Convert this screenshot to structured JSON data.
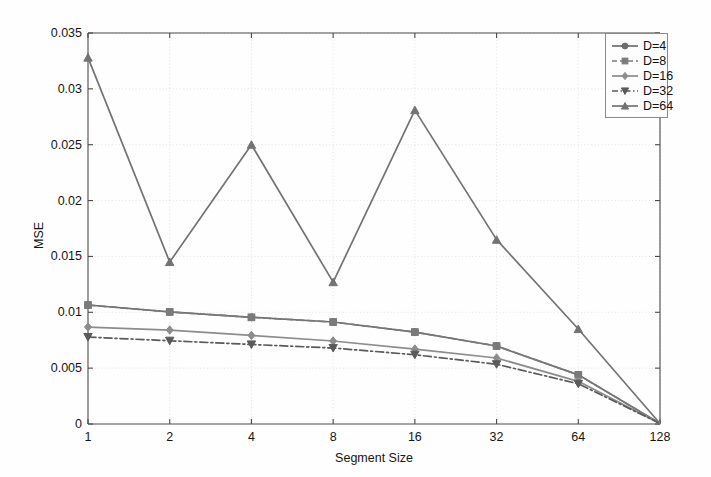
{
  "chart_data": {
    "type": "line",
    "title": "",
    "xlabel": "Segment Size",
    "ylabel": "MSE",
    "x_tick_labels": [
      "1",
      "2",
      "4",
      "8",
      "16",
      "32",
      "64",
      "128"
    ],
    "categories": [
      1,
      2,
      4,
      8,
      16,
      32,
      64,
      128
    ],
    "x_scale": "log2-evenly-spaced",
    "y_tick_labels": [
      "0",
      "0.005",
      "0.01",
      "0.015",
      "0.02",
      "0.025",
      "0.03",
      "0.035"
    ],
    "y_ticks": [
      0,
      0.005,
      0.01,
      0.015,
      0.02,
      0.025,
      0.03,
      0.035
    ],
    "ylim": [
      0,
      0.035
    ],
    "grid": true,
    "legend_position": "top-right",
    "series": [
      {
        "name": "D=4",
        "marker": "circle",
        "linestyle": "solid",
        "color": "#6e6e6e",
        "values": [
          0.01065,
          0.01003,
          0.00955,
          0.00913,
          0.00823,
          0.00698,
          0.0044,
          5e-05
        ]
      },
      {
        "name": "D=8",
        "marker": "square",
        "linestyle": "dashed",
        "color": "#7a7a7a",
        "values": [
          0.01065,
          0.01003,
          0.00955,
          0.00913,
          0.00823,
          0.00698,
          0.0044,
          5e-05
        ]
      },
      {
        "name": "D=16",
        "marker": "diamond",
        "linestyle": "solid",
        "color": "#8c8c8c",
        "values": [
          0.00868,
          0.00841,
          0.00793,
          0.00743,
          0.00671,
          0.00591,
          0.00382,
          5e-05
        ]
      },
      {
        "name": "D=32",
        "marker": "triangle-down",
        "linestyle": "dashdot",
        "color": "#5a5a5a",
        "values": [
          0.00778,
          0.00745,
          0.00712,
          0.0068,
          0.0062,
          0.00535,
          0.0036,
          5e-05
        ]
      },
      {
        "name": "D=64",
        "marker": "triangle-up",
        "linestyle": "solid",
        "color": "#737373",
        "values": [
          0.0328,
          0.0145,
          0.025,
          0.0127,
          0.0281,
          0.0165,
          0.0085,
          5e-05
        ]
      }
    ],
    "overlay_series_note": "D=4 and D=8 trace nearly the same path; D=8 drawn dashed on top",
    "annotations": []
  },
  "legend": {
    "items": [
      {
        "label": "D=4"
      },
      {
        "label": "D=8"
      },
      {
        "label": "D=16"
      },
      {
        "label": "D=32"
      },
      {
        "label": "D=64"
      }
    ]
  },
  "colors": {
    "axis": "#4a4a4a",
    "grid": "#dcdcdc",
    "background": "#fefefe",
    "text": "#151515"
  }
}
